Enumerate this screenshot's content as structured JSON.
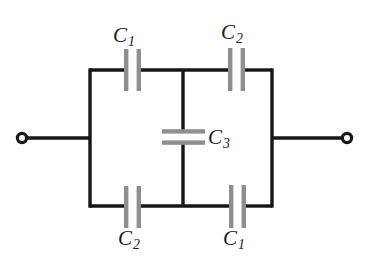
{
  "figure": {
    "background_color": "#ffffff",
    "wire_color": "#161616",
    "plate_color": "#8e8e8e",
    "plate_edge_color": "#b9b9b9",
    "label_color": "#1a1a1a",
    "terminal_fill": "#ffffff"
  },
  "labels": {
    "c1_top": {
      "symbol": "C",
      "subscript": "1"
    },
    "c2_top": {
      "symbol": "C",
      "subscript": "2"
    },
    "c3_middle": {
      "symbol": "C",
      "subscript": "3"
    },
    "c2_bottom": {
      "symbol": "C",
      "subscript": "2"
    },
    "c1_bottom": {
      "symbol": "C",
      "subscript": "1"
    }
  },
  "components": [
    {
      "name": "capacitor-c1-top",
      "label": "C1",
      "orientation": "vertical-plates",
      "branch": "top-left"
    },
    {
      "name": "capacitor-c2-top",
      "label": "C2",
      "orientation": "vertical-plates",
      "branch": "top-right"
    },
    {
      "name": "capacitor-c3-middle",
      "label": "C3",
      "orientation": "horizontal-plates",
      "branch": "bridge-center"
    },
    {
      "name": "capacitor-c2-bottom",
      "label": "C2",
      "orientation": "vertical-plates",
      "branch": "bottom-left"
    },
    {
      "name": "capacitor-c1-bottom",
      "label": "C1",
      "orientation": "vertical-plates",
      "branch": "bottom-right"
    }
  ],
  "terminals": [
    {
      "name": "terminal-left",
      "position": "left",
      "cx": 22,
      "cy": 138
    },
    {
      "name": "terminal-right",
      "position": "right",
      "cx": 347,
      "cy": 138
    }
  ],
  "geometry": {
    "rect_left": 90,
    "rect_right": 272,
    "rect_top": 70,
    "rect_bottom": 206,
    "mid_x": 183,
    "axis_y": 138
  }
}
